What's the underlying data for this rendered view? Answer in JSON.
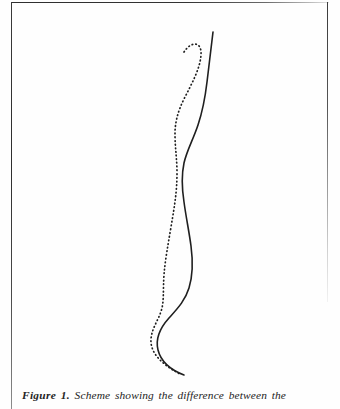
{
  "page": {
    "background_color": "#fefefe",
    "ink_color": "#2b2b2b"
  },
  "figure": {
    "caption_label": "Figure 1.",
    "caption_text": "Scheme showing the difference between the",
    "art_description": "scheme-two-sigmoid-curves",
    "curves": [
      {
        "name": "solid-curve",
        "style": "solid",
        "color": "#1f1f1f",
        "stroke_width": 1.6
      },
      {
        "name": "dotted-curve",
        "style": "dotted",
        "color": "#1f1f1f",
        "stroke_width": 1.7,
        "dash_pattern": "0.6 3.1"
      }
    ]
  },
  "rules": {
    "left_rule": "page-left-edge",
    "top_rule": "page-top-edge",
    "right_rule": "page-right-edge"
  }
}
